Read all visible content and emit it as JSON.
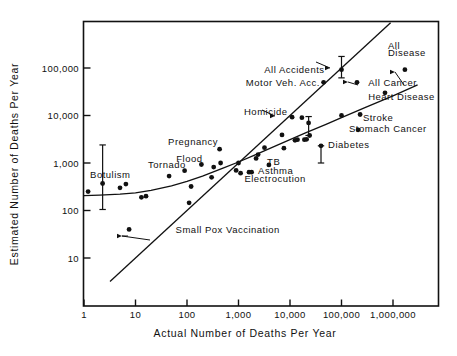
{
  "chart_data": {
    "type": "scatter",
    "title": "",
    "xlabel": "Actual Number of Deaths Per Year",
    "ylabel": "Estimated Number of Deaths Per Year",
    "xscale": "log",
    "yscale": "log",
    "xlim": [
      1,
      3000000
    ],
    "ylim": [
      3,
      700000
    ],
    "grid": false,
    "legend": null,
    "xticks": [
      "1",
      "10",
      "100",
      "1,000",
      "10,000",
      "100,000",
      "1,000,000"
    ],
    "xtick_values": [
      1,
      10,
      100,
      1000,
      10000,
      100000,
      1000000
    ],
    "yticks": [
      "10",
      "100",
      "1,000",
      "10,000",
      "100,000"
    ],
    "ytick_values": [
      10,
      100,
      1000,
      10000,
      100000
    ],
    "annotations": [
      {
        "text": "All Accidents",
        "x": 47000,
        "y": 95000,
        "anchor": "end",
        "leader": true
      },
      {
        "text": "All",
        "x": 800000,
        "y": 300000,
        "anchor": "start",
        "leader": false
      },
      {
        "text": "Disease",
        "x": 800000,
        "y": 210000,
        "anchor": "start",
        "leader": true
      },
      {
        "text": "Motor Veh. Acc.",
        "x": 38000,
        "y": 50000,
        "anchor": "end",
        "leader": false
      },
      {
        "text": "All Cancer",
        "x": 330000,
        "y": 50000,
        "anchor": "start",
        "leader": true
      },
      {
        "text": "Heart Disease",
        "x": 330000,
        "y": 25000,
        "anchor": "start",
        "leader": false
      },
      {
        "text": "Homicide",
        "x": 9000,
        "y": 12000,
        "anchor": "end",
        "leader": true
      },
      {
        "text": "Stroke",
        "x": 260000,
        "y": 9000,
        "anchor": "start",
        "leader": false
      },
      {
        "text": "Stomach Cancer",
        "x": 140000,
        "y": 5200,
        "anchor": "start",
        "leader": false
      },
      {
        "text": "Diabetes",
        "x": 55000,
        "y": 2500,
        "anchor": "start",
        "leader": false
      },
      {
        "text": "Pregnancy",
        "x": 400,
        "y": 2800,
        "anchor": "end",
        "leader": false
      },
      {
        "text": "Flood",
        "x": 200,
        "y": 1250,
        "anchor": "end",
        "leader": false
      },
      {
        "text": "Tornado",
        "x": 95,
        "y": 950,
        "anchor": "end",
        "leader": false
      },
      {
        "text": "Botulism",
        "x": 8,
        "y": 560,
        "anchor": "end",
        "leader": false
      },
      {
        "text": "TB",
        "x": 3600,
        "y": 1050,
        "anchor": "start",
        "leader": false
      },
      {
        "text": "Asthma",
        "x": 2400,
        "y": 680,
        "anchor": "start",
        "leader": false
      },
      {
        "text": "Electrocution",
        "x": 1300,
        "y": 480,
        "anchor": "start",
        "leader": false
      },
      {
        "text": "Small Pox Vaccination",
        "x": 60,
        "y": 40,
        "anchor": "start",
        "leader": true
      }
    ],
    "points": [
      {
        "x": 1.2,
        "y": 250
      },
      {
        "x": 2.3,
        "y": 370,
        "err_low": 105,
        "err_high": 2400
      },
      {
        "x": 5,
        "y": 300
      },
      {
        "x": 6.5,
        "y": 360
      },
      {
        "x": 7.5,
        "y": 40
      },
      {
        "x": 13,
        "y": 190
      },
      {
        "x": 16,
        "y": 200
      },
      {
        "x": 45,
        "y": 530
      },
      {
        "x": 90,
        "y": 690
      },
      {
        "x": 110,
        "y": 145
      },
      {
        "x": 120,
        "y": 320
      },
      {
        "x": 190,
        "y": 930
      },
      {
        "x": 300,
        "y": 500
      },
      {
        "x": 330,
        "y": 820
      },
      {
        "x": 430,
        "y": 1950
      },
      {
        "x": 450,
        "y": 1000
      },
      {
        "x": 900,
        "y": 700
      },
      {
        "x": 1000,
        "y": 1000
      },
      {
        "x": 1100,
        "y": 610
      },
      {
        "x": 1600,
        "y": 640
      },
      {
        "x": 1800,
        "y": 640
      },
      {
        "x": 2200,
        "y": 1250
      },
      {
        "x": 2400,
        "y": 1500
      },
      {
        "x": 3200,
        "y": 2100
      },
      {
        "x": 3900,
        "y": 910
      },
      {
        "x": 7000,
        "y": 3900
      },
      {
        "x": 7600,
        "y": 2050
      },
      {
        "x": 11000,
        "y": 9200
      },
      {
        "x": 12500,
        "y": 3000
      },
      {
        "x": 14000,
        "y": 3100
      },
      {
        "x": 17000,
        "y": 9000
      },
      {
        "x": 19000,
        "y": 3100
      },
      {
        "x": 21000,
        "y": 3150
      },
      {
        "x": 23000,
        "y": 7000,
        "err_low": 3800,
        "err_high": 9500
      },
      {
        "x": 24000,
        "y": 3800
      },
      {
        "x": 40000,
        "y": 2300,
        "err_low": 1000,
        "err_high": 2300
      },
      {
        "x": 45000,
        "y": 50000
      },
      {
        "x": 100000,
        "y": 92000,
        "err_low": 62000,
        "err_high": 175000
      },
      {
        "x": 100000,
        "y": 10000
      },
      {
        "x": 200000,
        "y": 50000
      },
      {
        "x": 210000,
        "y": 5000
      },
      {
        "x": 230000,
        "y": 10500
      },
      {
        "x": 700000,
        "y": 30000
      },
      {
        "x": 1700000,
        "y": 92000
      }
    ],
    "fit_curve_description": "Best fit curve of judged frequency vs actual frequency",
    "identity_line_description": "Diagonal identity line where estimated equals actual"
  }
}
